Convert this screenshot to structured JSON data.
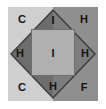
{
  "figure": {
    "panel": {
      "background_left_color": "#cfcfcf",
      "background_right_color": "#8f8f8f",
      "frame_color": "#b9b9b9",
      "outer_margin_color": "#ffffff"
    },
    "shapes": {
      "diamond": {
        "name": "rotated-square",
        "fill_left_color": "#6d6d6d",
        "fill_right_color": "#7d7d7d",
        "stroke_color": "#3c3c3c"
      },
      "inner_square": {
        "name": "inner-square",
        "fill_color": "#b0b0b0",
        "stroke_color": "#6e6e6e"
      }
    },
    "labels": {
      "corner_top_left": "C",
      "corner_top_right": "H",
      "corner_bottom_left": "C",
      "corner_bottom_right": "F",
      "vertex_top": "I",
      "vertex_left": "H",
      "vertex_right": "H",
      "vertex_bottom": "H",
      "center": "I"
    }
  }
}
